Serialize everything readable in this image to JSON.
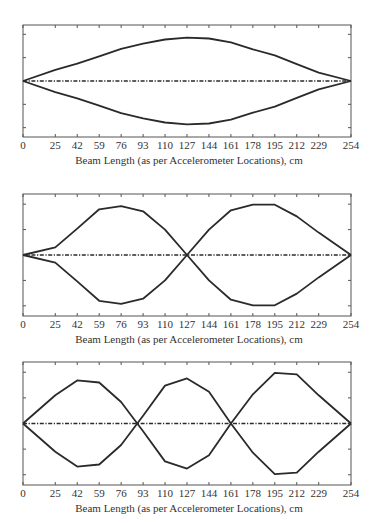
{
  "style": {
    "line_color": "#2a2a2a",
    "axis_color": "#555555",
    "background": "#ffffff"
  },
  "chart_data": [
    {
      "type": "line",
      "title": "",
      "xlabel": "Beam Length (as per Accelerometer Locations), cm",
      "ylabel": "",
      "x": [
        0,
        25,
        42,
        59,
        76,
        93,
        110,
        127,
        144,
        161,
        178,
        195,
        212,
        229,
        254
      ],
      "xticks": [
        "0",
        "25",
        "42",
        "59",
        "76",
        "93",
        "110",
        "127",
        "144",
        "161",
        "178",
        "195",
        "212",
        "229",
        "254"
      ],
      "xlim": [
        0,
        254
      ],
      "ylim": [
        -1.2,
        1.2
      ],
      "yticks_unlabeled": [
        -1,
        -0.5,
        0,
        0.5,
        1
      ],
      "series": [
        {
          "name": "mode shape (+)",
          "style": "solid",
          "values": [
            0,
            0.24,
            0.37,
            0.53,
            0.69,
            0.8,
            0.89,
            0.93,
            0.91,
            0.83,
            0.68,
            0.55,
            0.36,
            0.18,
            0
          ]
        },
        {
          "name": "mode shape (-)",
          "style": "solid",
          "values": [
            0,
            -0.24,
            -0.37,
            -0.53,
            -0.69,
            -0.8,
            -0.89,
            -0.93,
            -0.91,
            -0.83,
            -0.68,
            -0.55,
            -0.36,
            -0.18,
            0
          ]
        },
        {
          "name": "undeformed beam",
          "style": "dashdot",
          "values": [
            0,
            0,
            0,
            0,
            0,
            0,
            0,
            0,
            0,
            0,
            0,
            0,
            0,
            0,
            0
          ]
        }
      ],
      "grid": false,
      "legend": null
    },
    {
      "type": "line",
      "title": "",
      "xlabel": "Beam Length (as per Accelerometer Locations), cm",
      "ylabel": "",
      "x": [
        0,
        25,
        42,
        59,
        76,
        93,
        110,
        127,
        144,
        161,
        178,
        195,
        212,
        229,
        254
      ],
      "xticks": [
        "0",
        "25",
        "42",
        "59",
        "76",
        "93",
        "110",
        "127",
        "144",
        "161",
        "178",
        "195",
        "212",
        "229",
        "254"
      ],
      "xlim": [
        0,
        254
      ],
      "ylim": [
        -1.2,
        1.2
      ],
      "yticks_unlabeled": [
        -1,
        -0.5,
        0,
        0.5,
        1
      ],
      "series": [
        {
          "name": "mode shape (+)",
          "style": "solid",
          "values": [
            0,
            0.15,
            0.52,
            0.9,
            0.96,
            0.86,
            0.5,
            0,
            -0.5,
            -0.88,
            -0.99,
            -0.99,
            -0.76,
            -0.44,
            0
          ]
        },
        {
          "name": "mode shape (-)",
          "style": "solid",
          "values": [
            0,
            -0.15,
            -0.52,
            -0.9,
            -0.96,
            -0.86,
            -0.5,
            0,
            0.5,
            0.88,
            0.99,
            0.99,
            0.76,
            0.44,
            0
          ]
        },
        {
          "name": "undeformed beam",
          "style": "dashdot",
          "values": [
            0,
            0,
            0,
            0,
            0,
            0,
            0,
            0,
            0,
            0,
            0,
            0,
            0,
            0,
            0
          ]
        }
      ],
      "grid": false,
      "legend": null
    },
    {
      "type": "line",
      "title": "",
      "xlabel": "Beam Length (as per Accelerometer Locations), cm",
      "ylabel": "",
      "x": [
        0,
        25,
        42,
        59,
        76,
        93,
        110,
        127,
        144,
        161,
        178,
        195,
        212,
        229,
        254
      ],
      "xticks": [
        "0",
        "25",
        "42",
        "59",
        "76",
        "93",
        "110",
        "127",
        "144",
        "161",
        "178",
        "195",
        "212",
        "229",
        "254"
      ],
      "xlim": [
        0,
        254
      ],
      "ylim": [
        -1.2,
        1.2
      ],
      "yticks_unlabeled": [
        -1,
        -0.5,
        0,
        0.5,
        1
      ],
      "series": [
        {
          "name": "mode shape (+)",
          "style": "solid",
          "values": [
            0,
            0.55,
            0.84,
            0.8,
            0.42,
            -0.15,
            -0.74,
            -0.88,
            -0.62,
            0,
            0.57,
            0.99,
            0.96,
            0.55,
            0
          ]
        },
        {
          "name": "mode shape (-)",
          "style": "solid",
          "values": [
            0,
            -0.55,
            -0.84,
            -0.8,
            -0.42,
            0.15,
            0.74,
            0.88,
            0.62,
            0,
            -0.57,
            -0.99,
            -0.96,
            -0.55,
            0
          ]
        },
        {
          "name": "undeformed beam",
          "style": "dashdot",
          "values": [
            0,
            0,
            0,
            0,
            0,
            0,
            0,
            0,
            0,
            0,
            0,
            0,
            0,
            0,
            0
          ]
        }
      ],
      "grid": false,
      "legend": null
    }
  ],
  "layout": {
    "panels": [
      {
        "plot_left": 23,
        "plot_right": 351,
        "plot_top": 25,
        "plot_bottom": 137,
        "tick_label_y": 149,
        "xlabel_top": 154
      },
      {
        "plot_left": 23,
        "plot_right": 351,
        "plot_top": 194,
        "plot_bottom": 316,
        "tick_label_y": 328,
        "xlabel_top": 333
      },
      {
        "plot_left": 23,
        "plot_right": 351,
        "plot_top": 362,
        "plot_bottom": 485,
        "tick_label_y": 497,
        "xlabel_top": 502
      }
    ]
  }
}
